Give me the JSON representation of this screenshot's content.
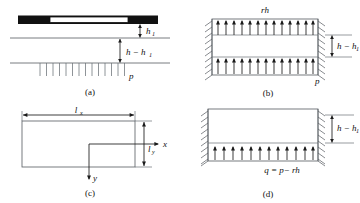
{
  "figure": {
    "background_color": "#ffffff",
    "line_color": "#555b60",
    "arrow_color": "#1a1a1a"
  },
  "panels": [
    {
      "id": "a",
      "caption": "(a)",
      "labels": {
        "depth_upper": "h",
        "depth_upper_sub": "1",
        "depth_lower": "h − h",
        "depth_lower_sub": "1",
        "pressure": "p"
      }
    },
    {
      "id": "b",
      "caption": "(b)",
      "labels": {
        "top_load": "rh",
        "side_depth": "h − h",
        "side_depth_sub": "1",
        "bottom_load": "p"
      }
    },
    {
      "id": "c",
      "caption": "(c)",
      "labels": {
        "length_x": "l",
        "length_x_sub": "x",
        "length_y": "l",
        "length_y_sub": "y",
        "axis_x": "x",
        "axis_y": "y"
      }
    },
    {
      "id": "d",
      "caption": "(d)",
      "labels": {
        "side_depth": "h − h",
        "side_depth_sub": "1",
        "net_load": "q = p− rh"
      }
    }
  ]
}
